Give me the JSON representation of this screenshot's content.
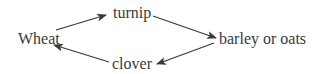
{
  "diagram": {
    "type": "cycle",
    "nodes": [
      {
        "id": "wheat",
        "label": "Wheat"
      },
      {
        "id": "turnip",
        "label": "turnip"
      },
      {
        "id": "barley",
        "label": "barley or oats"
      },
      {
        "id": "clover",
        "label": "clover"
      }
    ],
    "edges": [
      {
        "from": "wheat",
        "to": "turnip"
      },
      {
        "from": "turnip",
        "to": "barley"
      },
      {
        "from": "barley",
        "to": "clover"
      },
      {
        "from": "clover",
        "to": "wheat"
      }
    ],
    "colors": {
      "text": "#3a3a3a",
      "edge": "#3a3a3a",
      "background": "#ffffff"
    }
  }
}
